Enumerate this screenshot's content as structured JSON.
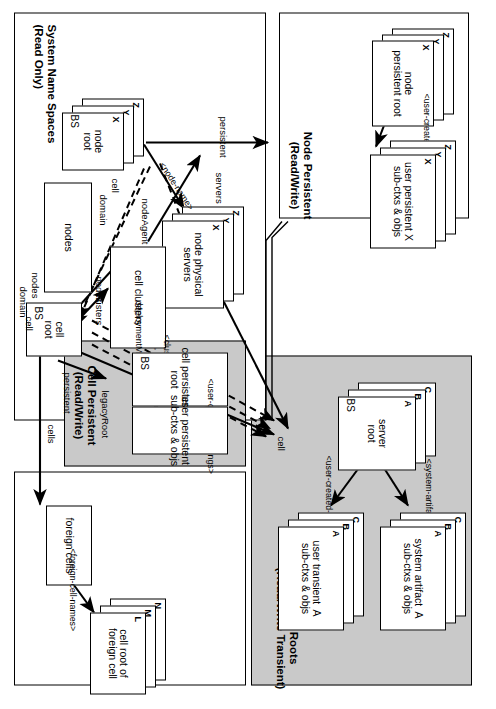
{
  "figure": {
    "caption": ""
  },
  "colors": {
    "panel_gray": "#c9c9c9",
    "panel_white": "#ffffff",
    "line": "#000000",
    "box_fill": "#ffffff"
  },
  "panels": [
    {
      "id": "node-persistent",
      "title": "Node Persistent\n(Read/Write)",
      "fill": "white"
    },
    {
      "id": "server-roots",
      "title": "Server Roots\n(Read/Write Transient)",
      "fill": "gray"
    },
    {
      "id": "system-name-spaces",
      "title": "System Name Spaces\n(Read Only)",
      "fill": "white"
    },
    {
      "id": "cell-persistent",
      "title": "Cell Persistent\n(Read/Write)",
      "fill": "gray"
    },
    {
      "id": "foreign-cells-panel",
      "title": "",
      "fill": "white"
    }
  ],
  "nodes": {
    "node_persistent_root": "node\npersistent root",
    "user_persistent_node": "user persistent X\nsub-ctxs & objs",
    "server_root": "server\nroot",
    "system_artifact": "system artifact  A\nsub-ctxs & objs",
    "user_transient": "user transient  A\nsub-ctxs & objs",
    "node_root": "node\nroot",
    "node_physical_servers": "node physical\nservers",
    "nodes_ctx": "nodes",
    "cell_clusters": "cell clusters",
    "cell_root": "cell\nroot",
    "cell_persistent_root": "cell persistent\nroot",
    "user_persistent_cell": "user persistent\nsub-ctxs & objs",
    "foreign_cells": "foreign cells",
    "cell_root_of_foreign_cell": "cell root of\nforeign cell"
  },
  "stack_tags": {
    "node_persistent_root": [
      "X",
      "Y",
      "Z"
    ],
    "user_persistent_node": [
      "X",
      "Y",
      "Z"
    ],
    "server_root": [
      "A",
      "B",
      "C"
    ],
    "system_artifact": [
      "A",
      "B",
      "C"
    ],
    "user_transient": [
      "A",
      "B",
      "C"
    ],
    "node_root": [
      "X",
      "Y",
      "Z"
    ],
    "node_physical_servers": [
      "X",
      "Y",
      "Z"
    ],
    "cell_root_of_foreign_cell": [
      "L",
      "M",
      "N"
    ]
  },
  "bs_markers": [
    {
      "for": "server_root",
      "label": "BS"
    },
    {
      "for": "node_root",
      "label": "BS"
    },
    {
      "for": "cell_root",
      "label": "BS"
    },
    {
      "for": "cell_persistent_root",
      "label": "BS"
    }
  ],
  "edge_labels": {
    "user_created_bindings_node": "<user-created-bindings>",
    "system_artifacts": "<system-artifacts>",
    "user_created_bindings_server": "<user-created-bindings>",
    "user_created_bindings_cell": "<user-created-bindings>",
    "persistent_node": "persistent",
    "servers": "servers",
    "physical_server_name": "<physical-server-name>",
    "node_agent": "nodeAgent",
    "node_name": "<node-name>",
    "cell_a": "cell",
    "domain_a": "domain",
    "nodes_a": "nodes",
    "nodes_b": "nodes",
    "clusters": "clusters",
    "deployment_manager": "deploymentManager",
    "cluster_name": "<cluster-name>",
    "cell_b": "cell",
    "domain_b": "domain",
    "cell_c": "cell",
    "persistent_cell": "persistent",
    "legacy_root": "legacyRoot",
    "cells": "cells",
    "foreign_cell_names": "<foreign-cell-names>"
  }
}
